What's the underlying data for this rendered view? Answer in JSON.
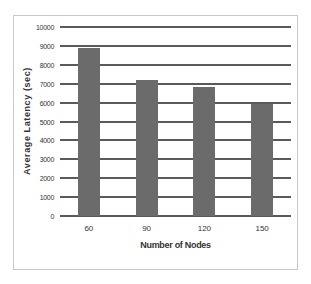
{
  "chart_data": {
    "type": "bar",
    "title": "",
    "xlabel": "Number of Nodes",
    "ylabel": "Average Latency (sec)",
    "categories": [
      "60",
      "90",
      "120",
      "150"
    ],
    "values": [
      8900,
      7200,
      6800,
      5950
    ],
    "ylim": [
      0,
      10000
    ],
    "yticks": [
      "0",
      "1000",
      "2000",
      "3000",
      "4000",
      "5000",
      "6000",
      "7000",
      "8000",
      "9000",
      "10000"
    ],
    "grid": true,
    "legend": null,
    "bar_color": "#6b6b6b"
  }
}
